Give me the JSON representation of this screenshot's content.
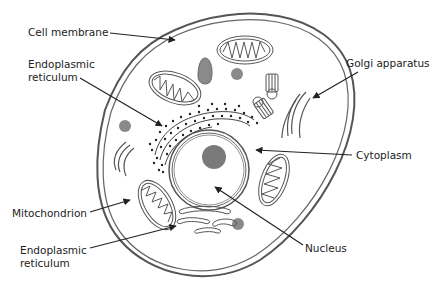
{
  "diagram": {
    "colors": {
      "line": "#555555",
      "arrow": "#222222",
      "text": "#222222",
      "organelle_fill": "#8a8a8a",
      "nucleolus_fill": "#7a7a7a",
      "background": "#ffffff"
    },
    "labels": [
      {
        "id": "cell-membrane",
        "text": "Cell membrane",
        "x": 28,
        "y": 24
      },
      {
        "id": "endoplasmic-reticulum-top",
        "text": "Endoplasmic\nreticulum",
        "x": 28,
        "y": 56
      },
      {
        "id": "golgi-apparatus",
        "text": "Golgi apparatus",
        "x": 346,
        "y": 56
      },
      {
        "id": "cytoplasm",
        "text": "Cytoplasm",
        "x": 356,
        "y": 148
      },
      {
        "id": "mitochondrion",
        "text": "Mitochondrion",
        "x": 12,
        "y": 206
      },
      {
        "id": "endoplasmic-reticulum-bottom",
        "text": "Endoplasmic\nreticulum",
        "x": 20,
        "y": 244
      },
      {
        "id": "nucleus",
        "text": "Nucleus",
        "x": 305,
        "y": 242
      }
    ]
  }
}
